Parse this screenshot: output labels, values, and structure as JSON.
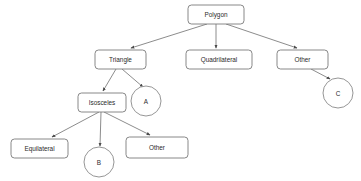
{
  "diagram": {
    "type": "hierarchy-tree",
    "style": {
      "background": "#ffffff",
      "box_fill": "#ffffff",
      "box_stroke": "#7a7a7a",
      "circle_stroke": "#8a8a8a",
      "edge_stroke": "#6f6f6f",
      "text_color": "#2b2b2b"
    },
    "nodes": [
      {
        "id": "polygon",
        "label": "Polygon",
        "shape": "rounded-rect",
        "x": 188,
        "y": 5,
        "w": 56,
        "h": 19
      },
      {
        "id": "triangle",
        "label": "Triangle",
        "shape": "rounded-rect",
        "x": 95,
        "y": 50,
        "w": 51,
        "h": 19
      },
      {
        "id": "quadrilateral",
        "label": "Quadrilateral",
        "shape": "rounded-rect",
        "x": 186,
        "y": 50,
        "w": 66,
        "h": 19
      },
      {
        "id": "other-top",
        "label": "Other",
        "shape": "rounded-rect",
        "x": 277,
        "y": 50,
        "w": 51,
        "h": 19
      },
      {
        "id": "isosceles",
        "label": "Isosceles",
        "shape": "rounded-rect",
        "x": 78,
        "y": 93,
        "w": 48,
        "h": 19
      },
      {
        "id": "equilateral",
        "label": "Equilateral",
        "shape": "rounded-rect",
        "x": 11,
        "y": 139,
        "w": 57,
        "h": 19
      },
      {
        "id": "other-bottom",
        "label": "Other",
        "shape": "rounded-rect",
        "x": 126,
        "y": 137,
        "w": 62,
        "h": 21
      },
      {
        "id": "node-a",
        "label": "A",
        "shape": "circle",
        "cx": 146,
        "cy": 101,
        "r": 15
      },
      {
        "id": "node-b",
        "label": "B",
        "shape": "circle",
        "cx": 99,
        "cy": 162,
        "r": 15
      },
      {
        "id": "node-c",
        "label": "C",
        "shape": "circle",
        "cx": 338,
        "cy": 93,
        "r": 15
      }
    ],
    "edges": [
      {
        "from": "polygon",
        "to": "triangle",
        "x1": 207,
        "y1": 24,
        "x2": 131,
        "y2": 48
      },
      {
        "from": "polygon",
        "to": "quadrilateral",
        "x1": 216,
        "y1": 24,
        "x2": 216,
        "y2": 48
      },
      {
        "from": "polygon",
        "to": "other-top",
        "x1": 226,
        "y1": 24,
        "x2": 297,
        "y2": 48
      },
      {
        "from": "triangle",
        "to": "isosceles",
        "x1": 116,
        "y1": 69,
        "x2": 103,
        "y2": 91
      },
      {
        "from": "triangle",
        "to": "node-a",
        "x1": 122,
        "y1": 69,
        "x2": 143,
        "y2": 87
      },
      {
        "from": "other-top",
        "to": "node-c",
        "x1": 311,
        "y1": 69,
        "x2": 330,
        "y2": 79
      },
      {
        "from": "isosceles",
        "to": "equilateral",
        "x1": 99,
        "y1": 112,
        "x2": 52,
        "y2": 137
      },
      {
        "from": "isosceles",
        "to": "node-b",
        "x1": 101,
        "y1": 112,
        "x2": 100,
        "y2": 146
      },
      {
        "from": "isosceles",
        "to": "other-bottom",
        "x1": 104,
        "y1": 112,
        "x2": 150,
        "y2": 135
      }
    ]
  }
}
